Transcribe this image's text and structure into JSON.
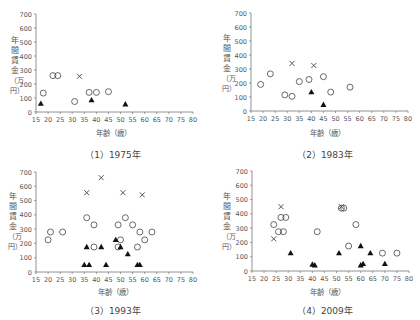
{
  "chart_data": [
    {
      "type": "scatter",
      "title": "(1) 1975年",
      "xlabel": "年齢（歳）",
      "ylabel": "年間賃金（万円）",
      "xlim": [
        15,
        80
      ],
      "ylim": [
        0,
        700
      ],
      "xticks": [
        15,
        20,
        25,
        30,
        35,
        40,
        45,
        50,
        55,
        60,
        65,
        70,
        75,
        80
      ],
      "yticks": [
        0,
        100,
        200,
        300,
        400,
        500,
        600,
        700
      ],
      "grid": false,
      "series": [
        {
          "name": "circle",
          "marker": "o",
          "points": [
            [
              18,
              135
            ],
            [
              22,
              260
            ],
            [
              24,
              260
            ],
            [
              31,
              75
            ],
            [
              37,
              140
            ],
            [
              40,
              140
            ],
            [
              45,
              145
            ]
          ]
        },
        {
          "name": "cross",
          "marker": "x",
          "points": [
            [
              33,
              255
            ]
          ]
        },
        {
          "name": "triangle",
          "marker": "^",
          "points": [
            [
              17,
              60
            ],
            [
              38,
              85
            ],
            [
              52,
              55
            ]
          ]
        }
      ]
    },
    {
      "type": "scatter",
      "title": "(2) 1983年",
      "xlabel": "年齢（歳）",
      "ylabel": "年間賃金（万円）",
      "xlim": [
        15,
        80
      ],
      "ylim": [
        0,
        700
      ],
      "xticks": [
        15,
        20,
        25,
        30,
        35,
        40,
        45,
        50,
        55,
        60,
        65,
        70,
        75,
        80
      ],
      "yticks": [
        0,
        100,
        200,
        300,
        400,
        500,
        600,
        700
      ],
      "grid": false,
      "series": [
        {
          "name": "circle",
          "marker": "o",
          "points": [
            [
              19,
              190
            ],
            [
              23,
              265
            ],
            [
              29,
              115
            ],
            [
              32,
              105
            ],
            [
              35,
              210
            ],
            [
              39,
              225
            ],
            [
              45,
              245
            ],
            [
              48,
              135
            ],
            [
              56,
              170
            ]
          ]
        },
        {
          "name": "cross",
          "marker": "x",
          "points": [
            [
              32,
              340
            ],
            [
              41,
              325
            ]
          ]
        },
        {
          "name": "triangle",
          "marker": "^",
          "points": [
            [
              40,
              135
            ],
            [
              45,
              45
            ]
          ]
        }
      ]
    },
    {
      "type": "scatter",
      "title": "(3) 1993年",
      "xlabel": "年齢（歳）",
      "ylabel": "年間賃金（万円）",
      "xlim": [
        15,
        80
      ],
      "ylim": [
        0,
        700
      ],
      "xticks": [
        15,
        20,
        25,
        30,
        35,
        40,
        45,
        50,
        55,
        60,
        65,
        70,
        75,
        80
      ],
      "yticks": [
        0,
        100,
        200,
        300,
        400,
        500,
        600,
        700
      ],
      "grid": false,
      "series": [
        {
          "name": "circle",
          "marker": "o",
          "points": [
            [
              20,
              225
            ],
            [
              21,
              280
            ],
            [
              26,
              280
            ],
            [
              36,
              380
            ],
            [
              39,
              330
            ],
            [
              39,
              175
            ],
            [
              49,
              330
            ],
            [
              49,
              175
            ],
            [
              50,
              225
            ],
            [
              52,
              380
            ],
            [
              55,
              330
            ],
            [
              57,
              175
            ],
            [
              58,
              280
            ],
            [
              60,
              225
            ],
            [
              63,
              280
            ]
          ]
        },
        {
          "name": "cross",
          "marker": "x",
          "points": [
            [
              36,
              555
            ],
            [
              42,
              660
            ],
            [
              51,
              555
            ],
            [
              59,
              540
            ]
          ]
        },
        {
          "name": "triangle",
          "marker": "^",
          "points": [
            [
              35,
              50
            ],
            [
              36,
              175
            ],
            [
              37,
              50
            ],
            [
              42,
              175
            ],
            [
              44,
              50
            ],
            [
              48,
              225
            ],
            [
              50,
              175
            ],
            [
              53,
              125
            ],
            [
              57,
              50
            ],
            [
              58,
              50
            ]
          ]
        }
      ]
    },
    {
      "type": "scatter",
      "title": "(4) 2009年",
      "xlabel": "年齢（歳）",
      "ylabel": "年間賃金（万円）",
      "xlim": [
        15,
        80
      ],
      "ylim": [
        0,
        700
      ],
      "xticks": [
        15,
        20,
        25,
        30,
        35,
        40,
        45,
        50,
        55,
        60,
        65,
        70,
        75,
        80
      ],
      "yticks": [
        0,
        100,
        200,
        300,
        400,
        500,
        600,
        700
      ],
      "grid": false,
      "series": [
        {
          "name": "circle",
          "marker": "o",
          "points": [
            [
              24,
              325
            ],
            [
              26,
              275
            ],
            [
              27,
              375
            ],
            [
              28,
              275
            ],
            [
              29,
              375
            ],
            [
              42,
              275
            ],
            [
              52,
              440
            ],
            [
              53,
              440
            ],
            [
              55,
              175
            ],
            [
              58,
              325
            ],
            [
              69,
              125
            ],
            [
              75,
              125
            ]
          ]
        },
        {
          "name": "cross",
          "marker": "x",
          "points": [
            [
              24,
              225
            ],
            [
              27,
              450
            ],
            [
              52,
              450
            ]
          ]
        },
        {
          "name": "triangle",
          "marker": "^",
          "points": [
            [
              31,
              125
            ],
            [
              40,
              45
            ],
            [
              41,
              40
            ],
            [
              51,
              125
            ],
            [
              60,
              175
            ],
            [
              60,
              40
            ],
            [
              61,
              50
            ],
            [
              64,
              125
            ],
            [
              70,
              50
            ]
          ]
        }
      ]
    }
  ],
  "panels": [
    {
      "caption": "（1）1975年",
      "xlabel": "年齢（歳）",
      "ylabel_chars": [
        "年",
        "間",
        "賃",
        "金",
        "（万",
        "円）"
      ]
    },
    {
      "caption": "（2）1983年",
      "xlabel": "年齢（歳）",
      "ylabel_chars": [
        "年",
        "間",
        "賃",
        "金",
        "（万",
        "円）"
      ]
    },
    {
      "caption": "（3）1993年",
      "xlabel": "年齢（歳）",
      "ylabel_chars": [
        "年",
        "間",
        "賃",
        "金",
        "（万",
        "円）"
      ]
    },
    {
      "caption": "（4）2009年",
      "xlabel": "年齢（歳）",
      "ylabel_chars": [
        "年",
        "間",
        "賃",
        "金",
        "（万",
        "円）"
      ]
    }
  ],
  "colors": {
    "axis": "#777777",
    "marker": "#444444",
    "text": "#555555"
  }
}
